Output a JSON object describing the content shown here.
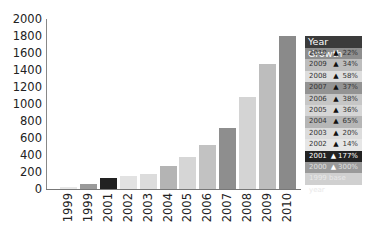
{
  "chart_data": {
    "type": "bar",
    "title": "",
    "xlabel": "",
    "ylabel": "",
    "ylim": [
      0,
      2000
    ],
    "yticks": [
      0,
      200,
      400,
      600,
      800,
      1000,
      1200,
      1400,
      1600,
      1800,
      2000
    ],
    "grid": false,
    "categories": [
      "1999",
      "1999",
      "2001",
      "2002",
      "2003",
      "2004",
      "2005",
      "2006",
      "2007",
      "2008",
      "2009",
      "2010"
    ],
    "values": [
      20,
      60,
      130,
      150,
      180,
      270,
      380,
      520,
      720,
      1080,
      1470,
      1800
    ],
    "bar_colors": [
      "#e8e8e8",
      "#9a9a9a",
      "#222222",
      "#e2e2e2",
      "#dcdcdc",
      "#b4b4b4",
      "#d6d6d6",
      "#c2c2c2",
      "#8e8e8e",
      "#d4d4d4",
      "#bdbdbd",
      "#8a8a8a"
    ],
    "legend": {
      "title": "Year Growth",
      "position": "right",
      "rows": [
        {
          "year": "2010",
          "pct": "22%",
          "bg": "#8e8e8e",
          "fg": "#333333",
          "tri": "#111111"
        },
        {
          "year": "2009",
          "pct": "34%",
          "bg": "#bdbdbd",
          "fg": "#333333",
          "tri": "#111111"
        },
        {
          "year": "2008",
          "pct": "58%",
          "bg": "#dedede",
          "fg": "#333333",
          "tri": "#111111"
        },
        {
          "year": "2007",
          "pct": "37%",
          "bg": "#939393",
          "fg": "#333333",
          "tri": "#111111"
        },
        {
          "year": "2006",
          "pct": "38%",
          "bg": "#c6c6c6",
          "fg": "#333333",
          "tri": "#111111"
        },
        {
          "year": "2005",
          "pct": "36%",
          "bg": "#d6d6d6",
          "fg": "#333333",
          "tri": "#111111"
        },
        {
          "year": "2004",
          "pct": "65%",
          "bg": "#b6b6b6",
          "fg": "#333333",
          "tri": "#111111"
        },
        {
          "year": "2003",
          "pct": "20%",
          "bg": "#dcdcdc",
          "fg": "#333333",
          "tri": "#111111"
        },
        {
          "year": "2002",
          "pct": "14%",
          "bg": "#e6e6e6",
          "fg": "#333333",
          "tri": "#111111"
        },
        {
          "year": "2001",
          "pct": "177%",
          "bg": "#222222",
          "fg": "#ffffff",
          "tri": "#ffffff"
        },
        {
          "year": "2000",
          "pct": "300%",
          "bg": "#9a9a9a",
          "fg": "#e0e0e0",
          "tri": "#ffffff"
        }
      ],
      "base_row": {
        "label": "1999 base year",
        "bg": "#d0d0d0"
      }
    }
  }
}
